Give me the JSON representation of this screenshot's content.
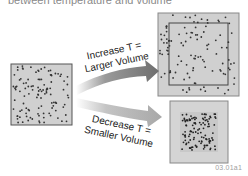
{
  "caption": {
    "text": "between temperature and volume"
  },
  "diagram": {
    "upper_arrow": {
      "label_line1": "Increase T =",
      "label_line2": "Larger Volume"
    },
    "lower_arrow": {
      "label_line1": "Decrease T =",
      "label_line2": "Smaller Volume"
    },
    "boxes": [
      {
        "id": "initial",
        "description": "Initial volume container with gas particles"
      },
      {
        "id": "larger",
        "description": "Expanded container, original boundary shown inside"
      },
      {
        "id": "smaller",
        "description": "Contracted container with tightly packed particles"
      }
    ],
    "colors": {
      "box_fill": "#d0d0d0",
      "box_border": "#555555",
      "particle": "#333333",
      "upper_arrow": "#7a7a7a",
      "lower_arrow": "#aaaaaa"
    }
  },
  "figure_id": "03.01a1"
}
